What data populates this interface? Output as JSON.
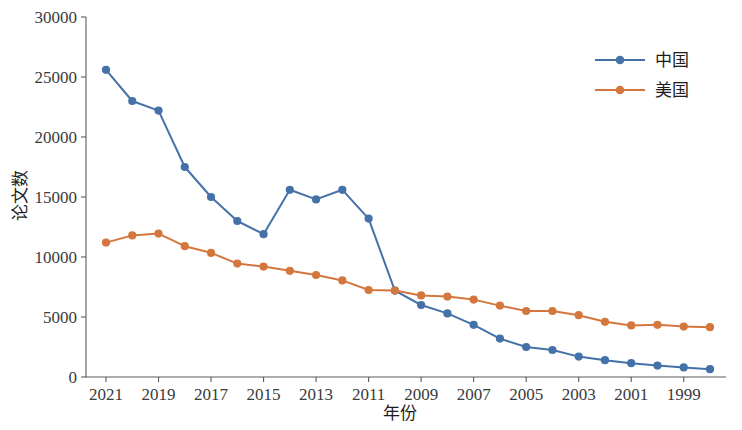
{
  "chart_data": {
    "type": "line",
    "title": "",
    "xlabel": "年份",
    "ylabel": "论文数",
    "x": [
      2021,
      2020,
      2019,
      2018,
      2017,
      2016,
      2015,
      2014,
      2013,
      2012,
      2011,
      2010,
      2009,
      2008,
      2007,
      2006,
      2005,
      2004,
      2003,
      2002,
      2001,
      2000,
      1999,
      1998
    ],
    "x_tick_labels": [
      "2021",
      "2019",
      "2017",
      "2015",
      "2013",
      "2011",
      "2009",
      "2007",
      "2005",
      "2003",
      "2001",
      "1999"
    ],
    "x_tick_values": [
      2021,
      2019,
      2017,
      2015,
      2013,
      2011,
      2009,
      2007,
      2005,
      2003,
      2001,
      1999
    ],
    "y_tick_labels": [
      "0",
      "5000",
      "10000",
      "15000",
      "20000",
      "25000",
      "30000"
    ],
    "y_tick_values": [
      0,
      5000,
      10000,
      15000,
      20000,
      25000,
      30000
    ],
    "ylim": [
      0,
      30000
    ],
    "xlim_reversed": true,
    "grid": false,
    "legend_position": "top-right",
    "series": [
      {
        "name": "中国",
        "color": "#4472a8",
        "marker": "circle",
        "values": [
          25600,
          23000,
          22200,
          17500,
          15000,
          13000,
          11900,
          15600,
          14800,
          15600,
          13200,
          7200,
          6000,
          5300,
          4350,
          3200,
          2500,
          2250,
          1700,
          1400,
          1150,
          950,
          800,
          650
        ]
      },
      {
        "name": "美国",
        "color": "#d4773e",
        "marker": "circle",
        "values": [
          11200,
          11800,
          11950,
          10900,
          10350,
          9450,
          9200,
          8850,
          8500,
          8050,
          7250,
          7200,
          6800,
          6700,
          6450,
          5950,
          5500,
          5500,
          5150,
          4600,
          4300,
          4350,
          4200,
          4150
        ]
      }
    ]
  },
  "legend": {
    "entries": [
      {
        "label": "中国"
      },
      {
        "label": "美国"
      }
    ]
  },
  "axes": {
    "y_title": "论文数",
    "x_title": "年份"
  }
}
